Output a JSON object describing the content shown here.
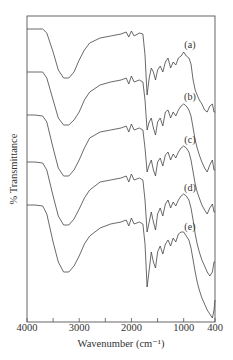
{
  "chart_data": {
    "type": "line",
    "title": "",
    "xlabel": "Wavenumber (cm⁻¹)",
    "ylabel": "% Transmittance",
    "xlim": [
      4000,
      400
    ],
    "x_reversed": true,
    "x_ticks": [
      4000,
      3000,
      2000,
      1000,
      400
    ],
    "x_tick_labels": [
      "4000",
      "3000",
      "2000",
      "1000",
      "400"
    ],
    "x_minor_ticks": [
      3500,
      2500,
      1500
    ],
    "y_ticks": [],
    "grid": false,
    "legend": "inline labels at right",
    "note": "Stacked FTIR spectra, vertically offset; y values are relative plot-pixel heights (smaller = higher on page).",
    "series": [
      {
        "name": "(a)",
        "label_pos": {
          "x": 880,
          "y": 46
        },
        "points": [
          [
            4000,
            29
          ],
          [
            3850,
            29
          ],
          [
            3700,
            29
          ],
          [
            3620,
            33
          ],
          [
            3500,
            52
          ],
          [
            3400,
            70
          ],
          [
            3300,
            78
          ],
          [
            3200,
            78
          ],
          [
            3100,
            72
          ],
          [
            3000,
            60
          ],
          [
            2900,
            50
          ],
          [
            2800,
            43
          ],
          [
            2600,
            38
          ],
          [
            2400,
            36
          ],
          [
            2200,
            34
          ],
          [
            2100,
            32
          ],
          [
            2050,
            37
          ],
          [
            2000,
            31
          ],
          [
            1950,
            36
          ],
          [
            1850,
            33
          ],
          [
            1780,
            34
          ],
          [
            1740,
            55
          ],
          [
            1700,
            95
          ],
          [
            1660,
            78
          ],
          [
            1620,
            68
          ],
          [
            1580,
            72
          ],
          [
            1540,
            80
          ],
          [
            1500,
            70
          ],
          [
            1450,
            66
          ],
          [
            1400,
            72
          ],
          [
            1350,
            62
          ],
          [
            1300,
            58
          ],
          [
            1250,
            68
          ],
          [
            1200,
            62
          ],
          [
            1150,
            65
          ],
          [
            1100,
            58
          ],
          [
            1050,
            56
          ],
          [
            1000,
            52
          ],
          [
            950,
            56
          ],
          [
            900,
            58
          ],
          [
            860,
            64
          ],
          [
            820,
            80
          ],
          [
            780,
            90
          ],
          [
            740,
            95
          ],
          [
            700,
            100
          ],
          [
            650,
            104
          ],
          [
            600,
            110
          ],
          [
            550,
            112
          ],
          [
            500,
            106
          ],
          [
            450,
            104
          ],
          [
            420,
            112
          ],
          [
            400,
            112
          ]
        ]
      },
      {
        "name": "(b)",
        "label_pos": {
          "x": 880,
          "y": 98
        },
        "points": [
          [
            4000,
            72
          ],
          [
            3850,
            72
          ],
          [
            3700,
            72
          ],
          [
            3620,
            78
          ],
          [
            3500,
            100
          ],
          [
            3400,
            118
          ],
          [
            3300,
            125
          ],
          [
            3200,
            125
          ],
          [
            3100,
            120
          ],
          [
            3000,
            112
          ],
          [
            2900,
            100
          ],
          [
            2800,
            92
          ],
          [
            2600,
            85
          ],
          [
            2400,
            82
          ],
          [
            2200,
            80
          ],
          [
            2100,
            78
          ],
          [
            2050,
            84
          ],
          [
            2000,
            76
          ],
          [
            1950,
            82
          ],
          [
            1850,
            80
          ],
          [
            1780,
            82
          ],
          [
            1740,
            100
          ],
          [
            1700,
            130
          ],
          [
            1660,
            122
          ],
          [
            1620,
            118
          ],
          [
            1580,
            128
          ],
          [
            1540,
            135
          ],
          [
            1500,
            122
          ],
          [
            1450,
            118
          ],
          [
            1400,
            126
          ],
          [
            1350,
            112
          ],
          [
            1300,
            110
          ],
          [
            1250,
            118
          ],
          [
            1200,
            112
          ],
          [
            1150,
            116
          ],
          [
            1100,
            110
          ],
          [
            1050,
            106
          ],
          [
            1000,
            104
          ],
          [
            950,
            106
          ],
          [
            900,
            110
          ],
          [
            860,
            116
          ],
          [
            820,
            128
          ],
          [
            780,
            140
          ],
          [
            740,
            148
          ],
          [
            700,
            155
          ],
          [
            650,
            162
          ],
          [
            600,
            168
          ],
          [
            550,
            172
          ],
          [
            500,
            165
          ],
          [
            450,
            160
          ],
          [
            420,
            170
          ],
          [
            400,
            170
          ]
        ]
      },
      {
        "name": "(c)",
        "label_pos": {
          "x": 880,
          "y": 141
        },
        "points": [
          [
            4000,
            115
          ],
          [
            3850,
            115
          ],
          [
            3700,
            116
          ],
          [
            3620,
            122
          ],
          [
            3500,
            148
          ],
          [
            3400,
            168
          ],
          [
            3300,
            176
          ],
          [
            3200,
            176
          ],
          [
            3100,
            170
          ],
          [
            3000,
            160
          ],
          [
            2900,
            148
          ],
          [
            2800,
            138
          ],
          [
            2600,
            132
          ],
          [
            2400,
            130
          ],
          [
            2200,
            128
          ],
          [
            2100,
            126
          ],
          [
            2050,
            132
          ],
          [
            2000,
            124
          ],
          [
            1950,
            130
          ],
          [
            1850,
            128
          ],
          [
            1780,
            130
          ],
          [
            1740,
            148
          ],
          [
            1700,
            172
          ],
          [
            1660,
            165
          ],
          [
            1620,
            160
          ],
          [
            1580,
            170
          ],
          [
            1540,
            176
          ],
          [
            1500,
            162
          ],
          [
            1450,
            158
          ],
          [
            1400,
            166
          ],
          [
            1350,
            155
          ],
          [
            1300,
            152
          ],
          [
            1250,
            160
          ],
          [
            1200,
            154
          ],
          [
            1150,
            158
          ],
          [
            1100,
            152
          ],
          [
            1050,
            148
          ],
          [
            1000,
            146
          ],
          [
            950,
            148
          ],
          [
            900,
            152
          ],
          [
            860,
            160
          ],
          [
            820,
            172
          ],
          [
            780,
            184
          ],
          [
            740,
            192
          ],
          [
            700,
            198
          ],
          [
            650,
            205
          ],
          [
            600,
            210
          ],
          [
            550,
            214
          ],
          [
            500,
            208
          ],
          [
            450,
            204
          ],
          [
            420,
            212
          ],
          [
            400,
            212
          ]
        ]
      },
      {
        "name": "(d)",
        "label_pos": {
          "x": 880,
          "y": 189
        },
        "points": [
          [
            4000,
            162
          ],
          [
            3850,
            162
          ],
          [
            3700,
            163
          ],
          [
            3620,
            170
          ],
          [
            3500,
            196
          ],
          [
            3400,
            216
          ],
          [
            3300,
            225
          ],
          [
            3200,
            225
          ],
          [
            3100,
            219
          ],
          [
            3000,
            209
          ],
          [
            2900,
            198
          ],
          [
            2800,
            190
          ],
          [
            2600,
            182
          ],
          [
            2400,
            180
          ],
          [
            2200,
            178
          ],
          [
            2100,
            176
          ],
          [
            2050,
            182
          ],
          [
            2000,
            174
          ],
          [
            1950,
            180
          ],
          [
            1850,
            178
          ],
          [
            1780,
            180
          ],
          [
            1740,
            200
          ],
          [
            1700,
            232
          ],
          [
            1660,
            222
          ],
          [
            1620,
            212
          ],
          [
            1580,
            222
          ],
          [
            1540,
            230
          ],
          [
            1500,
            214
          ],
          [
            1450,
            208
          ],
          [
            1400,
            216
          ],
          [
            1350,
            204
          ],
          [
            1300,
            200
          ],
          [
            1250,
            208
          ],
          [
            1200,
            202
          ],
          [
            1150,
            206
          ],
          [
            1100,
            200
          ],
          [
            1050,
            196
          ],
          [
            1000,
            194
          ],
          [
            950,
            196
          ],
          [
            900,
            200
          ],
          [
            860,
            208
          ],
          [
            820,
            220
          ],
          [
            780,
            234
          ],
          [
            740,
            244
          ],
          [
            700,
            252
          ],
          [
            650,
            260
          ],
          [
            600,
            266
          ],
          [
            550,
            272
          ],
          [
            500,
            276
          ],
          [
            450,
            272
          ],
          [
            420,
            262
          ],
          [
            400,
            262
          ]
        ]
      },
      {
        "name": "(e)",
        "label_pos": {
          "x": 880,
          "y": 228
        },
        "points": [
          [
            4000,
            205
          ],
          [
            3850,
            205
          ],
          [
            3700,
            206
          ],
          [
            3620,
            214
          ],
          [
            3500,
            242
          ],
          [
            3400,
            262
          ],
          [
            3300,
            272
          ],
          [
            3200,
            272
          ],
          [
            3100,
            266
          ],
          [
            3000,
            256
          ],
          [
            2900,
            244
          ],
          [
            2800,
            236
          ],
          [
            2600,
            228
          ],
          [
            2400,
            224
          ],
          [
            2200,
            222
          ],
          [
            2100,
            220
          ],
          [
            2050,
            226
          ],
          [
            2000,
            218
          ],
          [
            1950,
            224
          ],
          [
            1850,
            222
          ],
          [
            1780,
            224
          ],
          [
            1740,
            244
          ],
          [
            1700,
            287
          ],
          [
            1660,
            270
          ],
          [
            1620,
            252
          ],
          [
            1580,
            262
          ],
          [
            1540,
            268
          ],
          [
            1500,
            252
          ],
          [
            1450,
            246
          ],
          [
            1400,
            254
          ],
          [
            1350,
            244
          ],
          [
            1300,
            240
          ],
          [
            1250,
            246
          ],
          [
            1200,
            238
          ],
          [
            1150,
            242
          ],
          [
            1100,
            234
          ],
          [
            1050,
            232
          ],
          [
            1000,
            232
          ],
          [
            950,
            236
          ],
          [
            900,
            240
          ],
          [
            860,
            248
          ],
          [
            820,
            260
          ],
          [
            780,
            272
          ],
          [
            740,
            282
          ],
          [
            700,
            290
          ],
          [
            650,
            298
          ],
          [
            600,
            304
          ],
          [
            550,
            310
          ],
          [
            500,
            314
          ],
          [
            450,
            318
          ],
          [
            420,
            310
          ],
          [
            400,
            300
          ]
        ]
      }
    ]
  },
  "axes": {
    "frame_color": "#555555",
    "line_color": "#444444"
  }
}
